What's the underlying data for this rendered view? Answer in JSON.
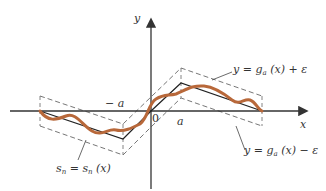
{
  "figure": {
    "axes": {
      "x_label": "x",
      "y_label": "y",
      "origin_label": "0"
    },
    "ticks": {
      "neg_a": "− a",
      "pos_a": "a"
    },
    "labels": {
      "upper_band": {
        "lhs": "y = g",
        "sub": "a",
        "rhs": " (x) + ε"
      },
      "lower_band": {
        "lhs": "y = g",
        "sub": "a",
        "rhs": " (x) − ε"
      },
      "series": {
        "s": "s",
        "sub1": "n",
        "mid": " = s",
        "sub2": "n",
        "rhs": " (x)"
      }
    },
    "colors": {
      "axis": "#333333",
      "function": "#222222",
      "band": "#666666",
      "series_curve": "#b8683a",
      "text": "#333333"
    }
  }
}
